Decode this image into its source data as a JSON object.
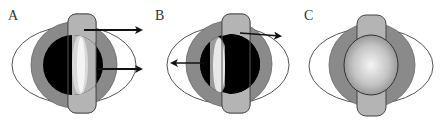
{
  "figure": {
    "panels": [
      {
        "label": "A",
        "description": "Black sphere with right-facing half shaded; two arrows pointing right",
        "arrows": [
          {
            "from": [
              84,
              30
            ],
            "to": [
              143,
              30
            ],
            "direction": "right"
          },
          {
            "from": [
              96,
              69
            ],
            "to": [
              143,
              69
            ],
            "direction": "right"
          }
        ]
      },
      {
        "label": "B",
        "description": "Black sphere with left-facing half shaded; one arrow right (upper), one arrow left (middle)",
        "arrows": [
          {
            "from": [
              240,
              33
            ],
            "to": [
              282,
              36
            ],
            "direction": "right"
          },
          {
            "from": [
              205,
              63
            ],
            "to": [
              170,
              63
            ],
            "direction": "left"
          }
        ]
      },
      {
        "label": "C",
        "description": "Uniform gray gradient sphere, no arrows",
        "arrows": []
      }
    ],
    "colors": {
      "outer_ellipse_fill": "#ffffff",
      "outer_ellipse_stroke": "#555555",
      "disc_fill": "#8a8a8a",
      "disc_stroke": "#555555",
      "pill_fill": "#b4b4b4",
      "pill_stroke": "#555555",
      "sphere_dark": "#000000",
      "sphere_highlight": "#f0f0f0",
      "sphere_c_center": "#f2f2f2",
      "sphere_c_edge": "#8c8c8c",
      "arrow": "#111111"
    }
  }
}
